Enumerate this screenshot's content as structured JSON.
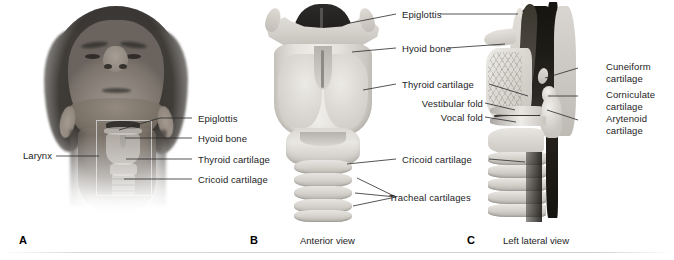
{
  "figure": {
    "background_color": "#ffffff",
    "text_color": "#1d1d1d",
    "leader_line_color": "#2a2a2a"
  },
  "panels": [
    {
      "letter": "A",
      "name": "surface-anatomy-photograph",
      "caption": "",
      "labels": [
        {
          "text": "Larynx",
          "align": "right"
        },
        {
          "text": "Epiglottis",
          "align": "left"
        },
        {
          "text": "Hyoid bone",
          "align": "left"
        },
        {
          "text": "Thyroid cartilage",
          "align": "left"
        },
        {
          "text": "Cricoid cartilage",
          "align": "left"
        }
      ]
    },
    {
      "letter": "B",
      "name": "anterior-view",
      "caption": "Anterior view",
      "labels": [
        {
          "text": "Epiglottis",
          "align": "left"
        },
        {
          "text": "Hyoid bone",
          "align": "left"
        },
        {
          "text": "Thyroid cartilage",
          "align": "left"
        },
        {
          "text": "Cricoid cartilage",
          "align": "left"
        },
        {
          "text": "Tracheal cartilages",
          "align": "left"
        }
      ]
    },
    {
      "letter": "C",
      "name": "left-lateral-view",
      "caption": "Left lateral view",
      "labels": [
        {
          "text": "Vestibular fold",
          "align": "right"
        },
        {
          "text": "Vocal fold",
          "align": "right"
        },
        {
          "text": "Cuneiform",
          "line2": "cartilage",
          "align": "left"
        },
        {
          "text": "Corniculate",
          "line2": "cartilage",
          "align": "left"
        },
        {
          "text": "Arytenoid",
          "line2": "cartilage",
          "align": "left"
        }
      ]
    }
  ],
  "labels": {
    "a_larynx": "Larynx",
    "a_epiglottis": "Epiglottis",
    "a_hyoid": "Hyoid bone",
    "a_thyroid": "Thyroid cartilage",
    "a_cricoid": "Cricoid cartilage",
    "b_epiglottis": "Epiglottis",
    "b_hyoid": "Hyoid bone",
    "b_thyroid": "Thyroid cartilage",
    "b_cricoid": "Cricoid cartilage",
    "b_tracheal": "Tracheal cartilages",
    "c_vestibular": "Vestibular fold",
    "c_vocal": "Vocal fold",
    "c_cuneiform_1": "Cuneiform",
    "c_cuneiform_2": "cartilage",
    "c_corniculate_1": "Corniculate",
    "c_corniculate_2": "cartilage",
    "c_arytenoid_1": "Arytenoid",
    "c_arytenoid_2": "cartilage"
  },
  "panel_letters": {
    "a": "A",
    "b": "B",
    "c": "C"
  },
  "captions": {
    "b": "Anterior view",
    "c": "Left lateral view"
  }
}
